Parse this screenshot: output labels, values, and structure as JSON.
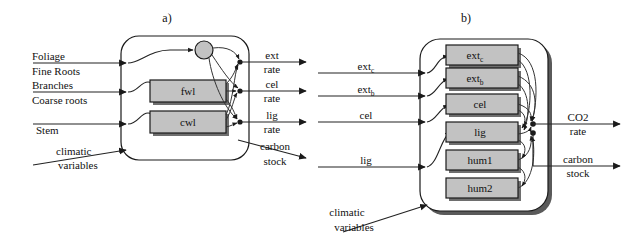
{
  "figure": {
    "background_color": "#ffffff",
    "line_color": "#222222",
    "box_fill_color": "#c2c2c2",
    "box_stroke_color": "#1a1a1a"
  },
  "panel_a": {
    "title": "a)",
    "inputs": [
      {
        "label": "Foliage"
      },
      {
        "label": "Fine Roots"
      },
      {
        "label": "Branches"
      },
      {
        "label": "Coarse roots"
      },
      {
        "label": "Stem"
      }
    ],
    "climatic": {
      "line1": "climatic",
      "line2": "variables"
    },
    "nodes": [
      {
        "name": "litter-circle",
        "label": "",
        "shape": "circle"
      },
      {
        "name": "fwl-box",
        "label": "fwl",
        "shape": "rect"
      },
      {
        "name": "cwl-box",
        "label": "cwl",
        "shape": "rect"
      }
    ],
    "outputs": [
      {
        "line1": "ext",
        "line2": "rate"
      },
      {
        "line1": "cel",
        "line2": "rate"
      },
      {
        "line1": "lig",
        "line2": "rate"
      },
      {
        "line1": "carbon",
        "line2": "stock"
      }
    ]
  },
  "panel_b": {
    "title": "b)",
    "inputs": [
      {
        "label": "ext",
        "sub": "c"
      },
      {
        "label": "ext",
        "sub": "b"
      },
      {
        "label": "cel",
        "sub": ""
      },
      {
        "label": "lig",
        "sub": ""
      }
    ],
    "climatic": {
      "line1": "climatic",
      "line2": "variables"
    },
    "nodes": [
      {
        "name": "ext-c-box",
        "label": "ext",
        "sub": "c"
      },
      {
        "name": "ext-b-box",
        "label": "ext",
        "sub": "b"
      },
      {
        "name": "cel-box",
        "label": "cel",
        "sub": ""
      },
      {
        "name": "lig-box",
        "label": "lig",
        "sub": ""
      },
      {
        "name": "hum1-box",
        "label": "hum1",
        "sub": ""
      },
      {
        "name": "hum2-box",
        "label": "hum2",
        "sub": ""
      }
    ],
    "outputs": [
      {
        "line1": "CO2",
        "line2": "rate"
      },
      {
        "line1": "carbon",
        "line2": "stock"
      }
    ]
  }
}
